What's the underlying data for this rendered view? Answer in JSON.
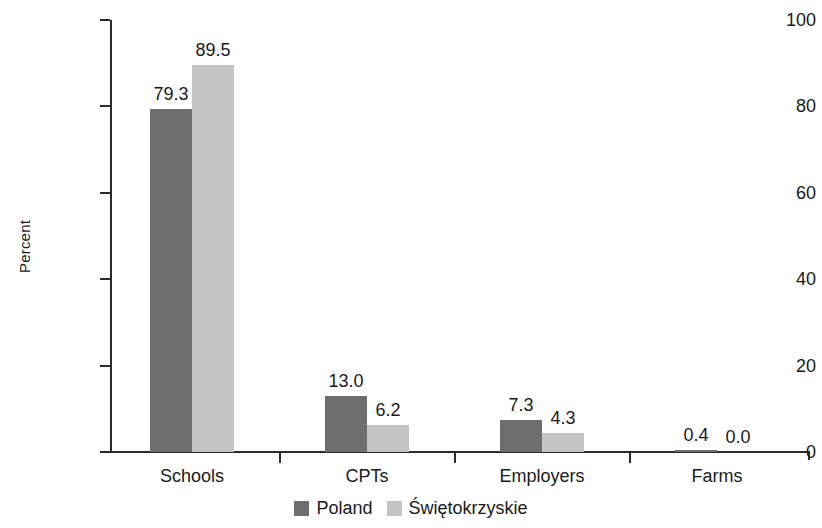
{
  "chart_data": {
    "type": "bar",
    "title": "",
    "xlabel": "",
    "ylabel": "Percent",
    "ylim": [
      0,
      100
    ],
    "yticks": [
      0,
      20,
      40,
      60,
      80,
      100
    ],
    "ytick_labels": [
      "0",
      "20",
      "40",
      "60",
      "80",
      "100"
    ],
    "categories": [
      "Schools",
      "CPTs",
      "Employers",
      "Farms"
    ],
    "grid": false,
    "legend_position": "bottom-center",
    "series": [
      {
        "name": "Poland",
        "color": "#6e6e6e",
        "values": [
          79.3,
          13.0,
          7.3,
          0.4
        ],
        "value_labels": [
          "79.3",
          "13.0",
          "7.3",
          "0.4"
        ]
      },
      {
        "name": "Świętokrzyskie",
        "color": "#c4c4c4",
        "values": [
          89.5,
          6.2,
          4.3,
          0.0
        ],
        "value_labels": [
          "89.5",
          "6.2",
          "4.3",
          "0.0"
        ]
      }
    ]
  },
  "axis": {
    "y_title": "Percent",
    "tick_labels": [
      "100",
      "80",
      "60",
      "40",
      "20",
      "0"
    ]
  },
  "categories": {
    "list": [
      "Schools",
      "CPTs",
      "Employers",
      "Farms"
    ]
  },
  "legend": {
    "items": [
      {
        "label": "Poland",
        "color": "#6e6e6e"
      },
      {
        "label": "Świętokrzyskie",
        "color": "#c4c4c4"
      }
    ]
  },
  "colors": {
    "series_poland": "#6e6e6e",
    "series_swietokrzyskie": "#c4c4c4",
    "axis": "#2b2b2b",
    "text": "#1a1a1a",
    "background": "#ffffff"
  }
}
